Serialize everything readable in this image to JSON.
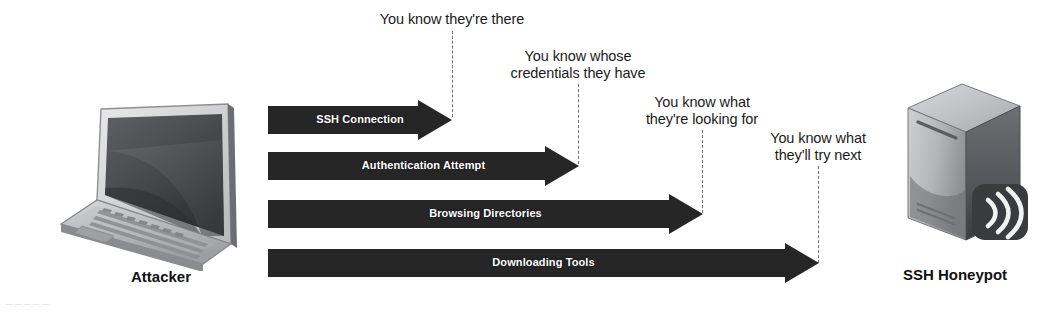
{
  "diagram": {
    "type": "sequence-flow",
    "background_color": "#ffffff",
    "arrow_fill_color": "#262626",
    "arrow_label_color": "#ffffff",
    "dash_line_color": "#6f6f6f",
    "text_color": "#1b1b1b"
  },
  "endpoints": {
    "left": {
      "caption": "Attacker",
      "icon": "laptop-icon"
    },
    "right": {
      "caption": "SSH Honeypot",
      "icon": "server-icon",
      "badge_icon": "wifi-broadcast-icon"
    }
  },
  "flows": [
    {
      "label": "SSH Connection",
      "annotation": "You know they're there",
      "annotation_lines": [
        "You know they're there"
      ]
    },
    {
      "label": "Authentication Attempt",
      "annotation": "You know whose credentials they have",
      "annotation_lines": [
        "You know whose",
        "credentials they have"
      ]
    },
    {
      "label": "Browsing Directories",
      "annotation": "You know what they're looking for",
      "annotation_lines": [
        "You know what",
        "they're looking for"
      ]
    },
    {
      "label": "Downloading Tools",
      "annotation": "You know what they'll try next",
      "annotation_lines": [
        "You know what",
        "they'll try next"
      ]
    }
  ],
  "artifact": {
    "text": "— — — — —"
  }
}
